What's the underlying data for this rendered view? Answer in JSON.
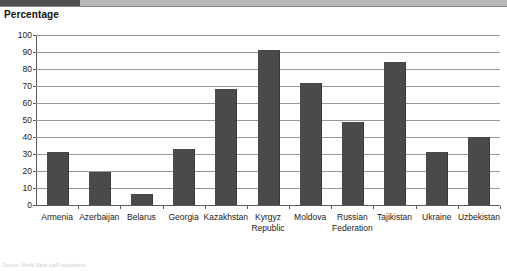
{
  "chart_title": "Percentage",
  "source_note": "Source: World Bank staff calculations.",
  "colors": {
    "bar": "#4a4a4a",
    "gridline": "#9a9a9a",
    "axis": "#5a5a5a",
    "band": "#b9b9b9",
    "band_accent": "#4f4f4f",
    "text": "#1a1a1a"
  },
  "chart_data": {
    "type": "bar",
    "title": "Percentage",
    "xlabel": "",
    "ylabel": "Percentage",
    "ylim": [
      0,
      100
    ],
    "ytick_step": 10,
    "yticks": [
      0,
      10,
      20,
      30,
      40,
      50,
      60,
      70,
      80,
      90,
      100
    ],
    "grid": true,
    "legend": false,
    "categories": [
      "Armenia",
      "Azerbaijan",
      "Belarus",
      "Georgia",
      "Kazakhstan",
      "Kyrgyz\nRepublic",
      "Moldova",
      "Russian\nFederation",
      "Tajikistan",
      "Ukraine",
      "Uzbekistan"
    ],
    "values": [
      31,
      19.5,
      6.5,
      33,
      68,
      91,
      72,
      49,
      84,
      31,
      40
    ]
  }
}
